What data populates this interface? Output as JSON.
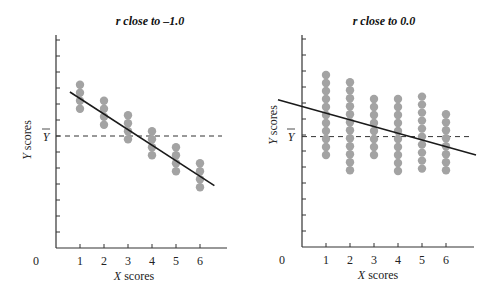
{
  "chart_data": [
    {
      "type": "scatter",
      "title": "r close to –1.0",
      "xlabel_italic": "X",
      "xlabel_rest": " scores",
      "ylabel_italic": "Y",
      "ylabel_rest": " scores",
      "mean_label": "Y",
      "origin_label": "0",
      "x_ticks": [
        "1",
        "2",
        "3",
        "4",
        "5",
        "6"
      ],
      "y_tick_count": 13,
      "mean_y": 7,
      "xlim": [
        0,
        7
      ],
      "ylim": [
        0,
        13.3
      ],
      "points_per_column": [
        4,
        4,
        4,
        4,
        4,
        4
      ],
      "points": [
        {
          "x": 1,
          "y": [
            10.2,
            9.7,
            9.2,
            8.7
          ]
        },
        {
          "x": 2,
          "y": [
            9.2,
            8.7,
            8.2,
            7.7
          ]
        },
        {
          "x": 3,
          "y": [
            8.3,
            7.8,
            7.3,
            6.8
          ]
        },
        {
          "x": 4,
          "y": [
            7.3,
            6.8,
            6.3,
            5.8
          ]
        },
        {
          "x": 5,
          "y": [
            6.3,
            5.8,
            5.3,
            4.8
          ]
        },
        {
          "x": 6,
          "y": [
            5.3,
            4.8,
            4.3,
            3.8
          ]
        }
      ],
      "regression_line": {
        "x1": 0.58,
        "y1": 9.75,
        "x2": 6.6,
        "y2": 3.9
      },
      "grid": false
    },
    {
      "type": "scatter",
      "title": "r close to 0.0",
      "xlabel_italic": "X",
      "xlabel_rest": " scores",
      "ylabel_italic": "Y",
      "ylabel_rest": " scores",
      "mean_label": "Y",
      "origin_label": "0",
      "x_ticks": [
        "1",
        "2",
        "3",
        "4",
        "5",
        "6"
      ],
      "y_tick_count": 13,
      "mean_y": 6.9,
      "xlim": [
        0,
        7
      ],
      "ylim": [
        0,
        13.3
      ],
      "points_per_column": [
        11,
        12,
        8,
        10,
        10,
        8
      ],
      "points": [
        {
          "x": 1,
          "y_top": 10.75,
          "y_bottom": 5.75,
          "count": 11
        },
        {
          "x": 2,
          "y_top": 10.3,
          "y_bottom": 4.8,
          "count": 12
        },
        {
          "x": 3,
          "y_top": 9.25,
          "y_bottom": 5.75,
          "count": 8
        },
        {
          "x": 4,
          "y_top": 9.25,
          "y_bottom": 4.75,
          "count": 10
        },
        {
          "x": 5,
          "y_top": 9.4,
          "y_bottom": 4.9,
          "count": 10
        },
        {
          "x": 6,
          "y_top": 8.3,
          "y_bottom": 4.8,
          "count": 8
        }
      ],
      "regression_line": {
        "x1": -1.0,
        "y1": 9.2,
        "x2": 7.25,
        "y2": 5.75
      },
      "grid": false
    }
  ],
  "colors": {
    "dot": "#a3a3a3",
    "line": "#1a1a1a",
    "axis": "#333333"
  }
}
